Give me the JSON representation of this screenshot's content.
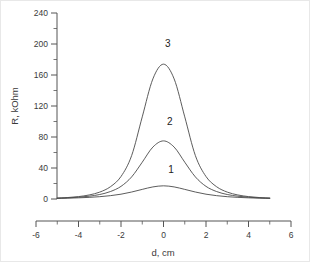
{
  "chart_data": {
    "type": "line",
    "title": "",
    "subtitle": "",
    "xlabel": "d, cm",
    "ylabel": "R, kOhm",
    "xlim": [
      -6,
      6
    ],
    "ylim": [
      0,
      250
    ],
    "xticks": [
      -6,
      -4,
      -2,
      0,
      2,
      4,
      6
    ],
    "xtick_labels": [
      "-6",
      "-4",
      "-2",
      "0",
      "2",
      "4",
      "6"
    ],
    "yticks": [
      0,
      40,
      80,
      120,
      160,
      200,
      240
    ],
    "ytick_labels": [
      "0",
      "40",
      "80",
      "120",
      "160",
      "200",
      "240"
    ],
    "x_minor_ticks_between": 1,
    "y_minor_ticks_between": 1,
    "grid": false,
    "legend_position": "inline-annotations",
    "frame": "left-bottom-only",
    "x": [
      -5.0,
      -4.5,
      -4.0,
      -3.5,
      -3.0,
      -2.5,
      -2.0,
      -1.5,
      -1.0,
      -0.5,
      0.0,
      0.5,
      1.0,
      1.5,
      2.0,
      2.5,
      3.0,
      3.5,
      4.0,
      4.5,
      5.0
    ],
    "series": [
      {
        "name": "1",
        "label": "1",
        "peak_value": 17,
        "peak_x": 0,
        "values": [
          0.8,
          1.1,
          1.5,
          2.1,
          3.0,
          4.3,
          6.2,
          9.0,
          12.4,
          15.6,
          17.0,
          15.6,
          12.4,
          9.0,
          6.2,
          4.3,
          3.0,
          2.1,
          1.5,
          1.1,
          0.8
        ]
      },
      {
        "name": "2",
        "label": "2",
        "peak_value": 75,
        "peak_x": 0,
        "values": [
          1.0,
          1.5,
          2.3,
          3.6,
          5.8,
          9.6,
          16.3,
          28.5,
          47.5,
          67.0,
          75.0,
          67.0,
          47.5,
          28.5,
          16.3,
          9.6,
          5.8,
          3.6,
          2.3,
          1.5,
          1.0
        ]
      },
      {
        "name": "3",
        "label": "3",
        "peak_value": 174,
        "peak_x": 0,
        "values": [
          1.2,
          1.9,
          3.1,
          5.2,
          8.9,
          15.8,
          29.0,
          56.0,
          106.0,
          155.0,
          174.0,
          155.0,
          106.0,
          56.0,
          29.0,
          15.8,
          8.9,
          5.2,
          3.1,
          1.9,
          1.2
        ]
      }
    ],
    "annotations": [
      {
        "text": "1",
        "x": 0.35,
        "y": 33
      },
      {
        "text": "2",
        "x": 0.3,
        "y": 96
      },
      {
        "text": "3",
        "x": 0.2,
        "y": 196
      }
    ],
    "colors": {
      "curve": "#4a4a4a",
      "axis": "#555555",
      "text": "#3a3a3a",
      "background": "#ffffff",
      "border": "#e8e8e8"
    }
  }
}
